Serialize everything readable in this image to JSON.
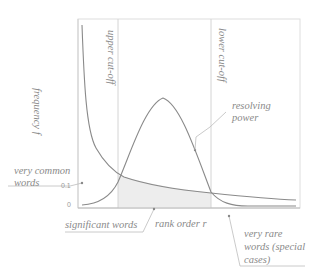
{
  "diagram": {
    "type": "word-frequency-rank-diagram",
    "axes": {
      "y_label": "frequency f",
      "x_label": "rank order r",
      "y_ticks": [
        "0.1",
        "0"
      ]
    },
    "cutoffs": {
      "upper": "upper cut-off",
      "lower": "lower cut-off"
    },
    "annotations": {
      "resolving_power": [
        "resolving",
        "power"
      ],
      "very_common_words": [
        "very common",
        "words"
      ],
      "significant_words": "significant words",
      "very_rare_words": [
        "very rare",
        "words (special",
        "cases)"
      ]
    },
    "colors": {
      "line": "#8c8c8c",
      "frame": "#d6d6d6",
      "shade": "#ececec",
      "text": "#8a8a8a"
    }
  }
}
